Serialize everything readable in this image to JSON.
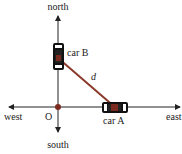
{
  "labels": {
    "north": "north",
    "south": "south",
    "east": "east",
    "west": "west",
    "origin": "O",
    "car_a": "car A",
    "car_b": "car B",
    "distance": "d"
  },
  "colors": {
    "axis": "#222222",
    "distance_line": "#8b3a2a",
    "origin_dot": "#7a2a1e",
    "car_body": "#111111",
    "car_window": "#ffffff",
    "car_marker": "#7a2a1e"
  }
}
